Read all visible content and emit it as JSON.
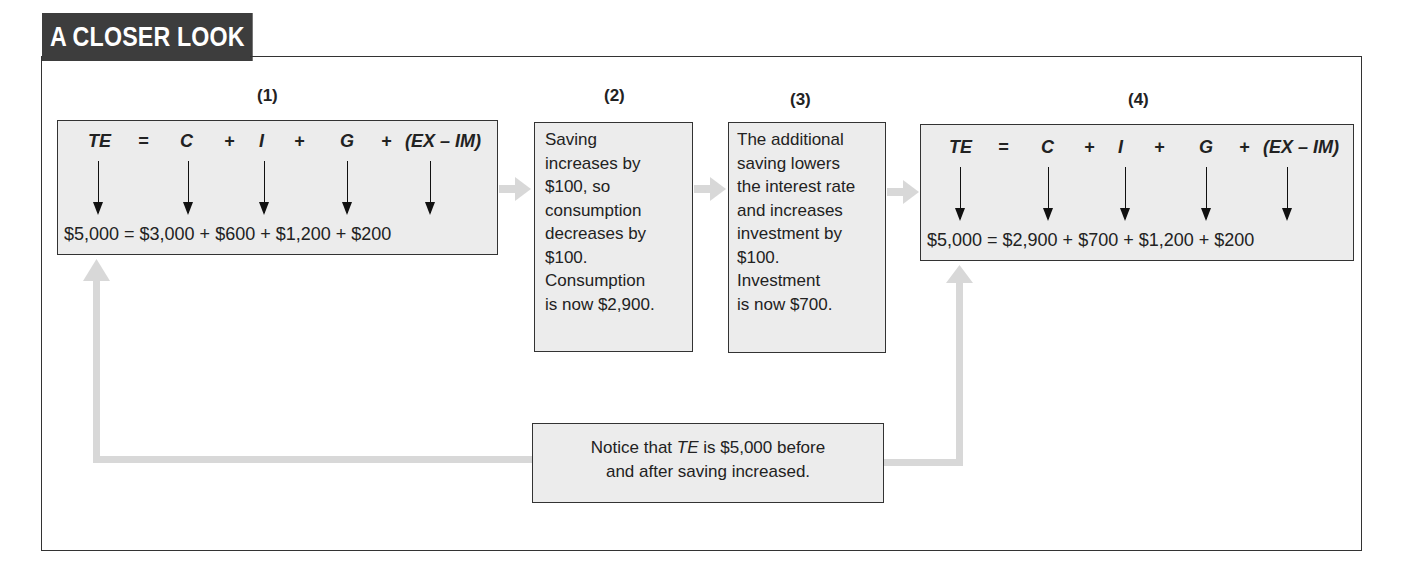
{
  "header": {
    "title": "A CLOSER LOOK"
  },
  "steps": [
    {
      "number": "(1)",
      "equation": {
        "te": "TE",
        "eq": "=",
        "c": "C",
        "plus1": "+",
        "i": "I",
        "plus2": "+",
        "g": "G",
        "plus3": "+",
        "net": "(EX – IM)"
      },
      "values": "$5,000 = $3,000 + $600 + $1,200 + $200"
    },
    {
      "number": "(2)",
      "lines": [
        "Saving",
        "increases by",
        "$100, so",
        "consumption",
        "decreases by",
        "$100.",
        "Consumption",
        "is now $2,900."
      ]
    },
    {
      "number": "(3)",
      "lines": [
        "The additional",
        "saving lowers",
        "the interest rate",
        "and increases",
        "investment by",
        "$100.",
        "Investment",
        "is now $700."
      ]
    },
    {
      "number": "(4)",
      "equation": {
        "te": "TE",
        "eq": "=",
        "c": "C",
        "plus1": "+",
        "i": "I",
        "plus2": "+",
        "g": "G",
        "plus3": "+",
        "net": "(EX – IM)"
      },
      "values": "$5,000 = $2,900 + $700 + $1,200 + $200"
    }
  ],
  "note": {
    "pre": "Notice that ",
    "italic": "TE",
    "post": " is $5,000 before",
    "line2": "and after saving increased."
  },
  "colors": {
    "tab_bg": "#3d3d3d",
    "box_bg": "#ececec",
    "flow_arrow": "#d8d8d8",
    "border": "#333333"
  }
}
